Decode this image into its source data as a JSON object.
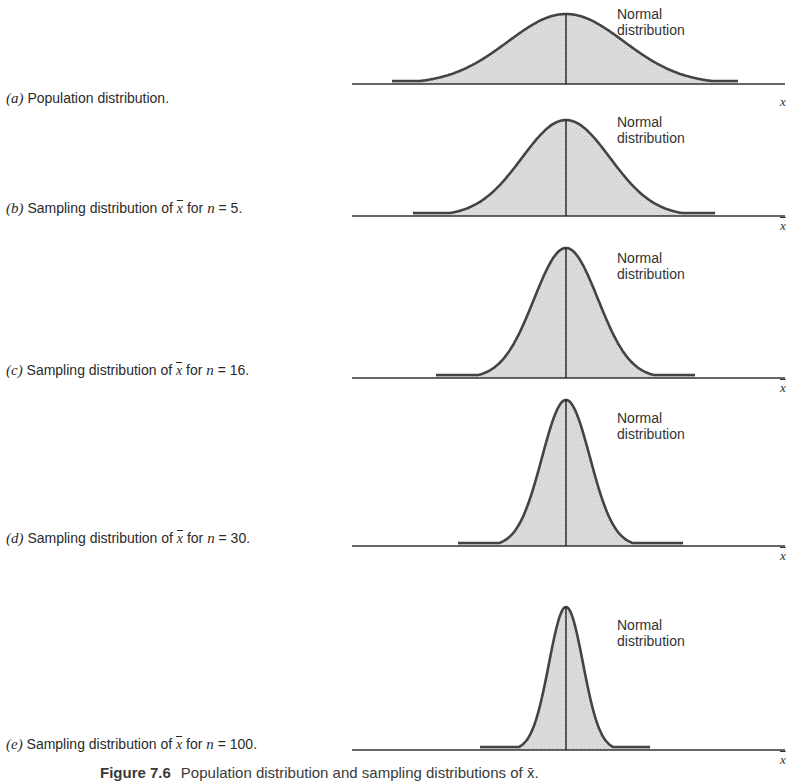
{
  "figure": {
    "caption_label": "Figure 7.6",
    "caption_text": "Population distribution and sampling distributions of x̄.",
    "curve_label_line1": "Normal",
    "curve_label_line2": "distribution",
    "fill_color": "#d9d9d9",
    "stroke_color": "#444444"
  },
  "panels": [
    {
      "letter": "(a)",
      "prefix": "Population distribution.",
      "stat": "",
      "mid": "",
      "n_var": "",
      "n_text": "",
      "axis_var": "x",
      "axis_bar": false
    },
    {
      "letter": "(b)",
      "prefix": "Sampling distribution of ",
      "stat": "x",
      "mid": " for ",
      "n_var": "n",
      "n_text": " = 5.",
      "axis_var": "x",
      "axis_bar": true
    },
    {
      "letter": "(c)",
      "prefix": "Sampling distribution of ",
      "stat": "x",
      "mid": " for ",
      "n_var": "n",
      "n_text": " = 16.",
      "axis_var": "x",
      "axis_bar": true
    },
    {
      "letter": "(d)",
      "prefix": "Sampling distribution of ",
      "stat": "x",
      "mid": " for ",
      "n_var": "n",
      "n_text": " = 30.",
      "axis_var": "x",
      "axis_bar": true
    },
    {
      "letter": "(e)",
      "prefix": "Sampling distribution of ",
      "stat": "x",
      "mid": " for ",
      "n_var": "n",
      "n_text": " = 100.",
      "axis_var": "x",
      "axis_bar": true
    }
  ],
  "chart_data": [
    {
      "type": "area",
      "title": "(a) Population distribution.",
      "xlabel": "x",
      "distribution": "normal",
      "relative_spread": 1.0,
      "annotation": "Normal distribution",
      "grid": false
    },
    {
      "type": "area",
      "title": "(b) Sampling distribution of x̄ for n = 5.",
      "xlabel": "x̄",
      "distribution": "normal",
      "n": 5,
      "relative_spread": 0.447,
      "annotation": "Normal distribution",
      "grid": false
    },
    {
      "type": "area",
      "title": "(c) Sampling distribution of x̄ for n = 16.",
      "xlabel": "x̄",
      "distribution": "normal",
      "n": 16,
      "relative_spread": 0.25,
      "annotation": "Normal distribution",
      "grid": false
    },
    {
      "type": "area",
      "title": "(d) Sampling distribution of x̄ for n = 30.",
      "xlabel": "x̄",
      "distribution": "normal",
      "n": 30,
      "relative_spread": 0.183,
      "annotation": "Normal distribution",
      "grid": false
    },
    {
      "type": "area",
      "title": "(e) Sampling distribution of x̄ for n = 100.",
      "xlabel": "x̄",
      "distribution": "normal",
      "n": 100,
      "relative_spread": 0.1,
      "annotation": "Normal distribution",
      "grid": false
    }
  ],
  "geometry": [
    {
      "baseline": 84,
      "peak": 14,
      "left": 392,
      "right": 738,
      "sigma": 58,
      "label_top": 90,
      "nlabel_top": 6,
      "var_top": 94
    },
    {
      "baseline": 216,
      "peak": 120,
      "left": 413,
      "right": 715,
      "sigma": 44,
      "label_top": 200,
      "nlabel_top": 114,
      "var_top": 218
    },
    {
      "baseline": 378,
      "peak": 248,
      "left": 436,
      "right": 695,
      "sigma": 32,
      "label_top": 362,
      "nlabel_top": 248,
      "var_top": 382
    },
    {
      "baseline": 546,
      "peak": 400,
      "left": 458,
      "right": 683,
      "sigma": 24,
      "label_top": 530,
      "nlabel_top": 410,
      "var_top": 549
    },
    {
      "baseline": 750,
      "peak": 607,
      "left": 480,
      "right": 650,
      "sigma": 17,
      "label_top": 736,
      "nlabel_top": 617,
      "var_top": 752
    }
  ]
}
